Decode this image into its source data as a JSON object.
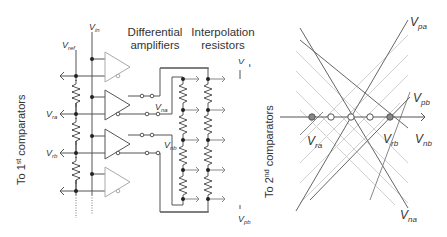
{
  "left_diagram": {
    "header_amplifiers_line1": "Differential",
    "header_amplifiers_line2": "amplifiers",
    "header_resistors_line1": "Interpolation",
    "header_resistors_line2": "resistors",
    "side_label": {
      "prefix": "To 1",
      "sup": "st",
      "suffix": " comparators"
    },
    "labels": {
      "vin": {
        "main": "V",
        "sub": "in"
      },
      "vref": {
        "main": "V",
        "sub": "ref"
      },
      "vra": {
        "main": "V",
        "sub": "ra"
      },
      "vrb": {
        "main": "V",
        "sub": "rb"
      },
      "vna": {
        "main": "V",
        "sub": "na"
      },
      "vnb": {
        "main": "V",
        "sub": "nb"
      },
      "vpa": {
        "main": "V",
        "sub": "pa"
      },
      "vpb": {
        "main": "V",
        "sub": "pb"
      }
    },
    "amplifier_count": 4,
    "interpolation_taps_per_ladder": 5
  },
  "right_diagram": {
    "side_label": {
      "prefix": "To 2",
      "sup": "nd",
      "suffix": " comparators"
    },
    "labels": {
      "vpa": {
        "main": "V",
        "sub": "pa"
      },
      "vpb": {
        "main": "V",
        "sub": "pb"
      },
      "vra": {
        "main": "V",
        "sub": "ra"
      },
      "vrb": {
        "main": "V",
        "sub": "rb"
      },
      "vnb": {
        "main": "V",
        "sub": "nb"
      },
      "vna": {
        "main": "V",
        "sub": "na"
      }
    },
    "crossing_points": {
      "filled": 2,
      "open": 3
    }
  },
  "colors": {
    "line": "#555555",
    "light_line": "#c8c8c8",
    "faint_amp": "#aaaaaa",
    "dot": "#222222",
    "filled_point": "#888888"
  }
}
